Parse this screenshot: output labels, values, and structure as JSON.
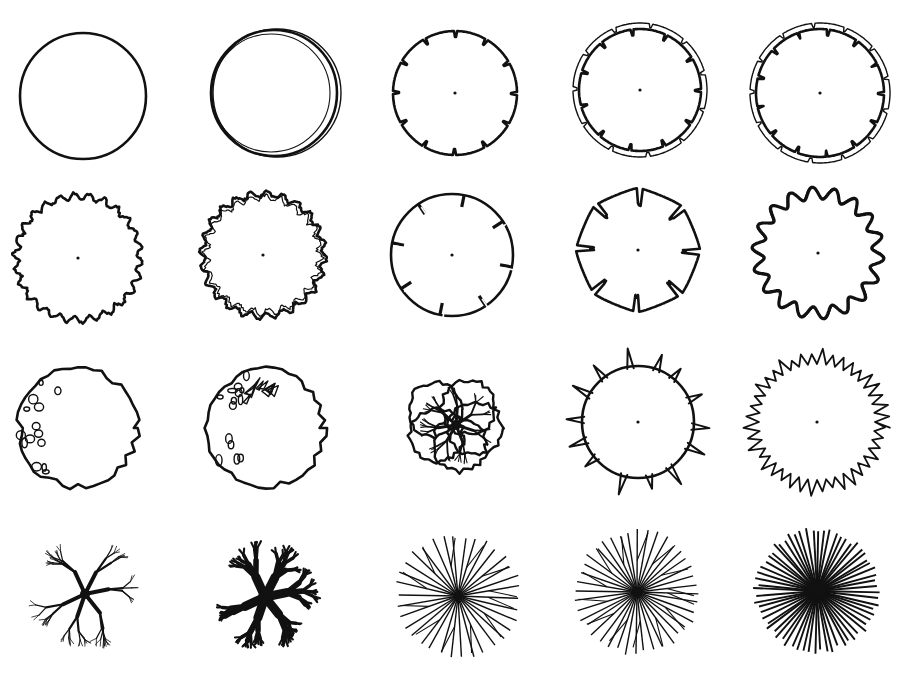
{
  "figure": {
    "grid": {
      "columns": 5,
      "rows": 4
    },
    "colors": {
      "ink": "#111111",
      "paper": "#ffffff"
    },
    "symbols": [
      {
        "id": "s1",
        "row": 1,
        "col": 1,
        "name": "plain-circle",
        "cx": 83,
        "cy": 96,
        "r": 63,
        "style": "plain"
      },
      {
        "id": "s2",
        "row": 1,
        "col": 2,
        "name": "double-offset-circle",
        "cx": 274,
        "cy": 93,
        "r": 63,
        "style": "double"
      },
      {
        "id": "s3",
        "row": 1,
        "col": 3,
        "name": "notched-circle",
        "cx": 455,
        "cy": 93,
        "r": 62,
        "style": "notched",
        "teeth": 12
      },
      {
        "id": "s4",
        "row": 1,
        "col": 4,
        "name": "double-notched-circle",
        "cx": 640,
        "cy": 90,
        "r": 61,
        "style": "double-notched",
        "teeth": 11
      },
      {
        "id": "s5",
        "row": 1,
        "col": 5,
        "name": "double-notched-ring-wide",
        "cx": 820,
        "cy": 93,
        "r": 64,
        "style": "double-notched",
        "teeth": 13
      },
      {
        "id": "s6",
        "row": 2,
        "col": 1,
        "name": "wavy-edge-circle",
        "cx": 78,
        "cy": 258,
        "r": 62,
        "style": "wavy",
        "teeth": 26
      },
      {
        "id": "s7",
        "row": 2,
        "col": 2,
        "name": "rough-double-wavy-circle",
        "cx": 263,
        "cy": 255,
        "r": 61,
        "style": "rough-wavy",
        "teeth": 24
      },
      {
        "id": "s8",
        "row": 2,
        "col": 3,
        "name": "slotted-circle",
        "cx": 452,
        "cy": 255,
        "r": 61,
        "style": "slotted",
        "teeth": 8
      },
      {
        "id": "s9",
        "row": 2,
        "col": 4,
        "name": "lobed-cracked-circle",
        "cx": 638,
        "cy": 250,
        "r": 62,
        "style": "lobed",
        "teeth": 8
      },
      {
        "id": "s10",
        "row": 2,
        "col": 5,
        "name": "scalloped-circle",
        "cx": 818,
        "cy": 253,
        "r": 60,
        "style": "scalloped",
        "teeth": 18
      },
      {
        "id": "s11",
        "row": 3,
        "col": 1,
        "name": "irregular-with-leaf-spots",
        "cx": 78,
        "cy": 428,
        "r": 63,
        "style": "irregular-spots"
      },
      {
        "id": "s12",
        "row": 3,
        "col": 2,
        "name": "irregular-with-branch-cluster",
        "cx": 266,
        "cy": 428,
        "r": 62,
        "style": "irregular-cluster"
      },
      {
        "id": "s13",
        "row": 3,
        "col": 3,
        "name": "branching-clumps",
        "cx": 456,
        "cy": 425,
        "r": 64,
        "style": "clumps"
      },
      {
        "id": "s14",
        "row": 3,
        "col": 4,
        "name": "spiked-circle-sparse",
        "cx": 638,
        "cy": 422,
        "r": 62,
        "style": "spiked",
        "teeth": 14
      },
      {
        "id": "s15",
        "row": 3,
        "col": 5,
        "name": "spiky-fringe-circle",
        "cx": 817,
        "cy": 422,
        "r": 64,
        "style": "fringe",
        "teeth": 40
      },
      {
        "id": "s16",
        "row": 4,
        "col": 1,
        "name": "bare-branch-thin",
        "cx": 85,
        "cy": 594,
        "r": 63,
        "style": "branches-thin"
      },
      {
        "id": "s17",
        "row": 4,
        "col": 2,
        "name": "bare-branch-heavy",
        "cx": 265,
        "cy": 597,
        "r": 63,
        "style": "branches-heavy"
      },
      {
        "id": "s18",
        "row": 4,
        "col": 3,
        "name": "radiating-twigs",
        "cx": 458,
        "cy": 596,
        "r": 64,
        "style": "radial-branched",
        "teeth": 34
      },
      {
        "id": "s19",
        "row": 4,
        "col": 4,
        "name": "radiating-lines-star",
        "cx": 637,
        "cy": 592,
        "r": 64,
        "style": "radial-star",
        "teeth": 40
      },
      {
        "id": "s20",
        "row": 4,
        "col": 5,
        "name": "dense-radiating-lines",
        "cx": 817,
        "cy": 591,
        "r": 64,
        "style": "radial-dense",
        "teeth": 64
      }
    ]
  }
}
